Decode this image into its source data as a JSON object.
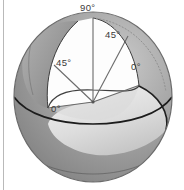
{
  "figure": {
    "kind": "sphere-elevation-angle-diagram",
    "canvas": {
      "width": 184,
      "height": 190
    },
    "colors": {
      "background": "#ffffff",
      "outline": "#2b2b2b",
      "sphere_outer_shade": "#8b8b8b",
      "sphere_lower_shade": "#9a9a9a",
      "sphere_bottom_band": "#6f6f6f",
      "cut_interior_light": "#e3e3e3",
      "cut_interior_mid": "#cfcfcf",
      "wedge_white": "#fdfdfd",
      "crescent_shade": "#9c9c9c",
      "label_text": "#3a3a3a",
      "border_line": "#b9b9b9",
      "dotted_arc": "#8a8a8a"
    },
    "labels": [
      {
        "id": "top",
        "text": "90°",
        "angle_deg": 90,
        "position": "top-apex"
      },
      {
        "id": "right45",
        "text": "45°",
        "angle_deg": 45,
        "position": "upper-right-meridian"
      },
      {
        "id": "left45",
        "text": "45°",
        "angle_deg": 45,
        "position": "upper-left-meridian"
      },
      {
        "id": "right0",
        "text": "0°",
        "angle_deg": 0,
        "position": "right-equator"
      },
      {
        "id": "left0",
        "text": "0°",
        "angle_deg": 0,
        "position": "left-equator"
      }
    ],
    "geometry": {
      "sphere_center": {
        "x": 93,
        "y": 97
      },
      "sphere_radius_x": 79,
      "sphere_radius_y": 85,
      "origin_point": {
        "x": 93,
        "y": 102
      },
      "apex_point": {
        "x": 93,
        "y": 18
      }
    }
  }
}
